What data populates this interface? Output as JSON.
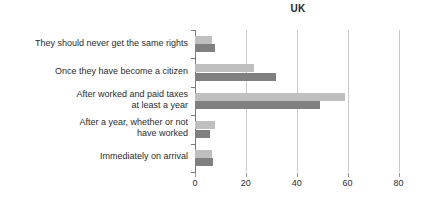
{
  "chart_data": {
    "type": "bar",
    "orientation": "horizontal",
    "title": "UK",
    "xlabel": "",
    "ylabel": "",
    "xlim": [
      0,
      80
    ],
    "xticks": [
      0,
      20,
      40,
      60,
      80
    ],
    "xtick_labels": [
      "0",
      "20",
      "40",
      "60",
      "80"
    ],
    "grid": true,
    "legend": "none",
    "categories": [
      "They should never get the same rights",
      "Once they have become a citizen",
      "After worked and paid taxes\nat least a year",
      "After a year, whether or not\nhave worked",
      "Immediately on arrival"
    ],
    "series": [
      {
        "name": "series-light",
        "color": "#bfbfbf",
        "values": [
          6.5,
          23,
          59,
          8,
          6.5
        ]
      },
      {
        "name": "series-dark",
        "color": "#808080",
        "values": [
          8,
          32,
          49,
          6,
          7
        ]
      }
    ]
  }
}
